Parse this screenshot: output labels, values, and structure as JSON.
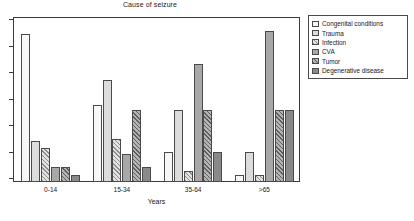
{
  "chart_data": {
    "type": "bar",
    "title": "Cause of seizure",
    "xlabel": "Years",
    "ylabel": "",
    "grid": false,
    "legend_position": "right-outside",
    "y_axis": {
      "labels_shown": false,
      "tick_count": 7,
      "ylim": [
        0,
        100
      ]
    },
    "categories": [
      "0-14",
      "15-34",
      "35-64",
      ">65"
    ],
    "series": [
      {
        "name": "Congenital conditions",
        "fill": "solid-near-white",
        "color": "#f7f7f7",
        "values": [
          90,
          47,
          18,
          4
        ]
      },
      {
        "name": "Trauma",
        "fill": "solid-light-gray",
        "color": "#dcdcdc",
        "values": [
          25,
          62,
          44,
          18
        ]
      },
      {
        "name": "Infection",
        "fill": "diagonal-hatch-light",
        "color": "#e2e2e2",
        "values": [
          21,
          26,
          7,
          4
        ]
      },
      {
        "name": "CVA",
        "fill": "solid-medium-gray",
        "color": "#a8a8a8",
        "values": [
          9,
          17,
          72,
          92
        ]
      },
      {
        "name": "Tumor",
        "fill": "diagonal-hatch-medium",
        "color": "#b4b4b4",
        "values": [
          9,
          44,
          44,
          44
        ]
      },
      {
        "name": "Degenerative disease",
        "fill": "solid-dark-gray",
        "color": "#8a8a8a",
        "values": [
          4,
          9,
          18,
          44
        ]
      }
    ]
  }
}
